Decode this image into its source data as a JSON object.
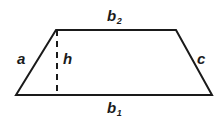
{
  "figure": {
    "name": "trapezoid-diagram",
    "type": "geometry-diagram",
    "background_color": "#ffffff",
    "stroke_color": "#1a1a1a",
    "stroke_width": 2,
    "canvas": {
      "width": 223,
      "height": 123
    },
    "shape": {
      "name": "trapezoid",
      "vertices": {
        "bottom_left": {
          "x": 16,
          "y": 95
        },
        "top_left": {
          "x": 56,
          "y": 30
        },
        "top_right": {
          "x": 176,
          "y": 30
        },
        "bottom_right": {
          "x": 212,
          "y": 95
        }
      },
      "outline_path": "M 16 95 L 56 30 L 176 30 L 212 95 Z"
    },
    "height_segment": {
      "name": "height-dashed-line",
      "x": 57,
      "y_top": 30,
      "y_bottom": 95,
      "style": "dashed",
      "dash_pattern": "6 5"
    },
    "labels": {
      "top_base": {
        "text": "b",
        "subscript": "2"
      },
      "bottom_base": {
        "text": "b",
        "subscript": "1"
      },
      "left_side": {
        "text": "a",
        "subscript": ""
      },
      "right_side": {
        "text": "c",
        "subscript": ""
      },
      "height": {
        "text": "h",
        "subscript": ""
      }
    }
  }
}
